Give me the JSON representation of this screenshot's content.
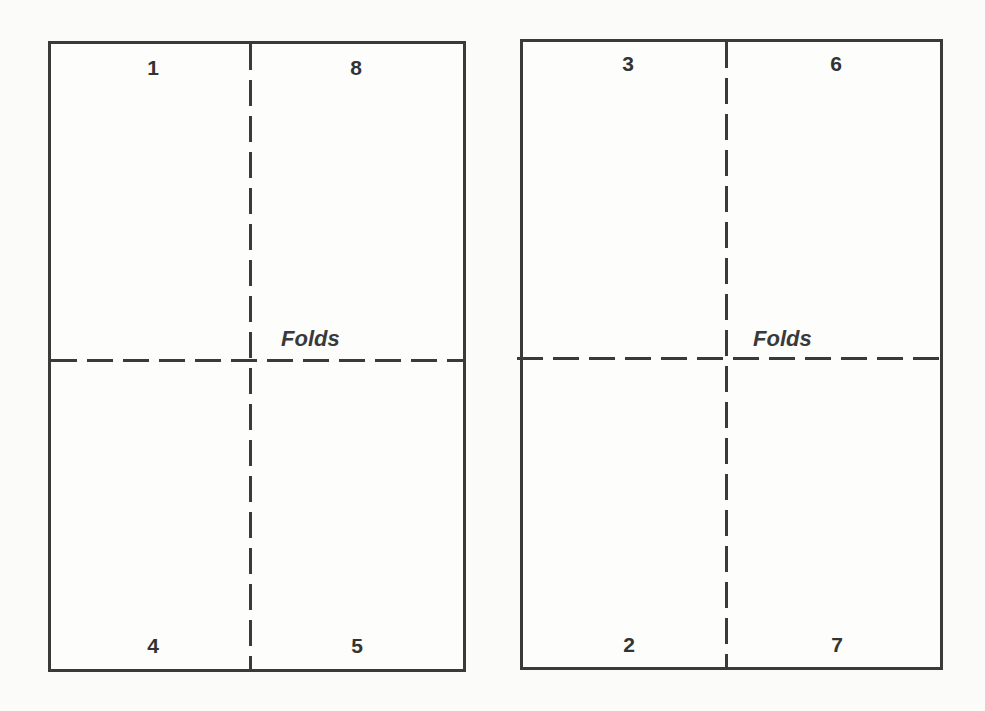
{
  "diagram": {
    "type": "imposition-layout",
    "sheets": [
      {
        "id": "left",
        "panels": {
          "top_left": "1",
          "top_right": "8",
          "bottom_left": "4",
          "bottom_right": "5"
        },
        "fold_label": "Folds"
      },
      {
        "id": "right",
        "panels": {
          "top_left": "3",
          "top_right": "6",
          "bottom_left": "2",
          "bottom_right": "7"
        },
        "fold_label": "Folds"
      }
    ],
    "colors": {
      "line": "#3a3a3a",
      "text": "#333333",
      "background": "#fbfbfa"
    }
  }
}
